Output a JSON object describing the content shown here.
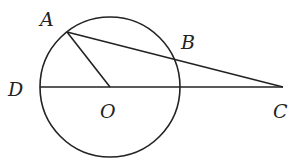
{
  "diagram": {
    "type": "geometry",
    "circle": {
      "center": "O",
      "cx": 110,
      "cy": 87,
      "r": 70
    },
    "points": {
      "A": {
        "label": "A",
        "x": 67,
        "y": 32,
        "lx": 40,
        "ly": 26
      },
      "B": {
        "label": "B",
        "x": 176,
        "y": 61,
        "lx": 181,
        "ly": 48
      },
      "C": {
        "label": "C",
        "x": 283,
        "y": 87,
        "lx": 273,
        "ly": 117
      },
      "D": {
        "label": "D",
        "x": 40,
        "y": 87,
        "lx": 8,
        "ly": 95
      },
      "O": {
        "label": "O",
        "x": 110,
        "y": 87,
        "lx": 100,
        "ly": 117
      }
    },
    "segments": [
      {
        "name": "AO",
        "from": "A",
        "to": "O"
      },
      {
        "name": "AC",
        "from": "A",
        "to": "C"
      },
      {
        "name": "DC",
        "from": "D",
        "to": "C"
      }
    ]
  }
}
